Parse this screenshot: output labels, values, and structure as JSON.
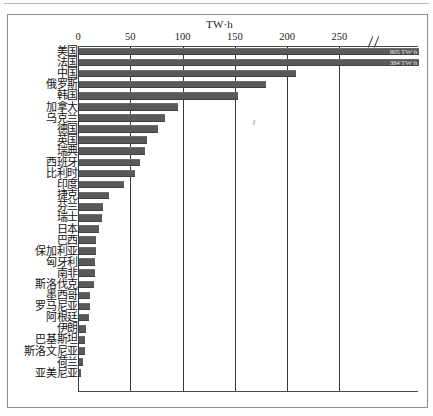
{
  "chart_data": {
    "type": "bar",
    "orientation": "horizontal",
    "title": "",
    "unit_label": "TW·h",
    "xlabel": "TW·h",
    "ylabel": "",
    "xlim": [
      0,
      290
    ],
    "xticks": [
      0,
      50,
      100,
      150,
      200,
      250
    ],
    "axis_break": "//",
    "grid": true,
    "grid_axis": "x",
    "legend": null,
    "bar_color": "#595959",
    "categories": [
      "美国",
      "法国",
      "中国",
      "俄罗斯",
      "韩国",
      "加拿大",
      "乌克兰",
      "德国",
      "英国",
      "瑞典",
      "西班牙",
      "比利时",
      "印度",
      "捷克",
      "芬兰",
      "瑞士",
      "日本",
      "巴西",
      "保加利亚",
      "匈牙利",
      "南非",
      "斯洛伐克",
      "墨西哥",
      "罗马尼亚",
      "阿根廷",
      "伊朗",
      "巴基斯坦",
      "斯洛文尼亚",
      "荷兰",
      "亚美尼亚"
    ],
    "values": [
      805,
      384,
      208,
      179,
      152,
      95,
      82,
      76,
      65,
      63,
      58,
      54,
      43,
      29,
      23,
      22,
      19,
      16,
      16,
      15,
      15,
      14,
      11,
      11,
      10,
      7,
      6,
      6,
      4,
      2
    ],
    "data_labels": [
      "805 TW·h",
      "384 TW·h",
      "",
      "",
      "",
      "",
      "",
      "",
      "",
      "",
      "",
      "",
      "",
      "",
      "",
      "",
      "",
      "",
      "",
      "",
      "",
      "",
      "",
      "",
      "",
      "",
      "",
      "",
      "",
      ""
    ]
  }
}
